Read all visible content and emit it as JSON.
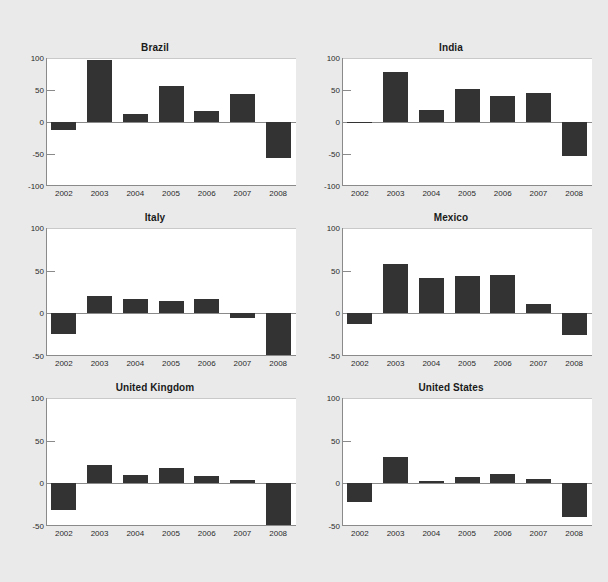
{
  "figure": {
    "background_color": "#eaeaea",
    "plot_background_color": "#ffffff",
    "bar_color": "#333333",
    "axis_color": "#8a8a8a",
    "text_color": "#2b2b2b",
    "rows": 3,
    "cols": 2
  },
  "chart_data": [
    {
      "type": "bar",
      "title": "Brazil",
      "categories": [
        "2002",
        "2003",
        "2004",
        "2005",
        "2006",
        "2007",
        "2008"
      ],
      "values": [
        -12,
        97,
        12,
        57,
        17,
        43,
        -57
      ],
      "xlabel": "",
      "ylabel": "",
      "ylim": [
        -100,
        100
      ],
      "yticks": [
        100,
        50,
        0,
        -50,
        -100
      ],
      "ytick_labels": [
        "100",
        "50",
        "0",
        "-50",
        "-100"
      ],
      "grid": false,
      "legend": "none"
    },
    {
      "type": "bar",
      "title": "India",
      "categories": [
        "2002",
        "2003",
        "2004",
        "2005",
        "2006",
        "2007",
        "2008"
      ],
      "values": [
        -1,
        78,
        18,
        51,
        41,
        46,
        -53
      ],
      "xlabel": "",
      "ylabel": "",
      "ylim": [
        -100,
        100
      ],
      "yticks": [
        100,
        50,
        0,
        -50,
        -100
      ],
      "ytick_labels": [
        "100",
        "50",
        "0",
        "-50",
        "-100"
      ],
      "grid": false,
      "legend": "none"
    },
    {
      "type": "bar",
      "title": "Italy",
      "categories": [
        "2002",
        "2003",
        "2004",
        "2005",
        "2006",
        "2007",
        "2008"
      ],
      "values": [
        -24,
        20,
        17,
        14,
        17,
        -6,
        -50
      ],
      "xlabel": "",
      "ylabel": "",
      "ylim": [
        -50,
        100
      ],
      "yticks": [
        100,
        50,
        0,
        -50
      ],
      "ytick_labels": [
        "100",
        "50",
        "0",
        "-50"
      ],
      "grid": false,
      "legend": "none"
    },
    {
      "type": "bar",
      "title": "Mexico",
      "categories": [
        "2002",
        "2003",
        "2004",
        "2005",
        "2006",
        "2007",
        "2008"
      ],
      "values": [
        -12,
        58,
        41,
        44,
        45,
        11,
        -25
      ],
      "xlabel": "",
      "ylabel": "",
      "ylim": [
        -50,
        100
      ],
      "yticks": [
        100,
        50,
        0,
        -50
      ],
      "ytick_labels": [
        "100",
        "50",
        "0",
        "-50"
      ],
      "grid": false,
      "legend": "none"
    },
    {
      "type": "bar",
      "title": "United Kingdom",
      "categories": [
        "2002",
        "2003",
        "2004",
        "2005",
        "2006",
        "2007",
        "2008"
      ],
      "values": [
        -31,
        22,
        10,
        18,
        9,
        4,
        -50
      ],
      "xlabel": "",
      "ylabel": "",
      "ylim": [
        -50,
        100
      ],
      "yticks": [
        100,
        50,
        0,
        -50
      ],
      "ytick_labels": [
        "100",
        "50",
        "0",
        "-50"
      ],
      "grid": false,
      "legend": "none"
    },
    {
      "type": "bar",
      "title": "United States",
      "categories": [
        "2002",
        "2003",
        "2004",
        "2005",
        "2006",
        "2007",
        "2008"
      ],
      "values": [
        -22,
        31,
        3,
        7,
        11,
        5,
        -40
      ],
      "xlabel": "",
      "ylabel": "",
      "ylim": [
        -50,
        100
      ],
      "yticks": [
        100,
        50,
        0,
        -50
      ],
      "ytick_labels": [
        "100",
        "50",
        "0",
        "-50"
      ],
      "grid": false,
      "legend": "none"
    }
  ]
}
